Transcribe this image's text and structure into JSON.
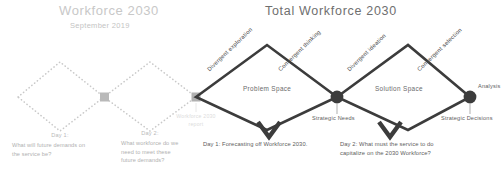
{
  "canvas": {
    "width": 504,
    "height": 169,
    "background": "#ffffff"
  },
  "colors": {
    "faded": "#c8c8c8",
    "faded_text": "#b4b4b4",
    "dark_line": "#3c3c3c",
    "dark_text": "#5d5d5d",
    "node_dark": "#3c3c3c",
    "node_faded": "#b5b5b5",
    "ghost": "#dcdcdc"
  },
  "left_phase": {
    "title": "Workforce 2030",
    "subtitle": "September 2019",
    "report_note": "Workforce 2030\nreport",
    "steps": [
      {
        "heading": "Day 1:",
        "body": "What will future demands on\nthe service be?"
      },
      {
        "heading": "Day 2:",
        "body": "What workforce do we\nneed to meet these\nfuture demands?"
      }
    ]
  },
  "right_phase": {
    "title": "Total Workforce 2030",
    "diamonds": [
      {
        "label": "Problem Space"
      },
      {
        "label": "Solution Space"
      }
    ],
    "edge_labels": [
      "Divergent exploration",
      "Convergent thinking",
      "Divergent ideation",
      "Convergent selection"
    ],
    "nodes": [
      {
        "label": "Strategic Needs",
        "position": "center"
      },
      {
        "label": "Analysis",
        "position": "right-top"
      },
      {
        "label": "Strategic Decisions",
        "position": "right-bottom"
      }
    ],
    "captions": [
      "Day 1: Forecasting off Workforce 2030.",
      "Day 2: What must the service to do\ncapitalize on the 2030 Workforce?"
    ]
  }
}
